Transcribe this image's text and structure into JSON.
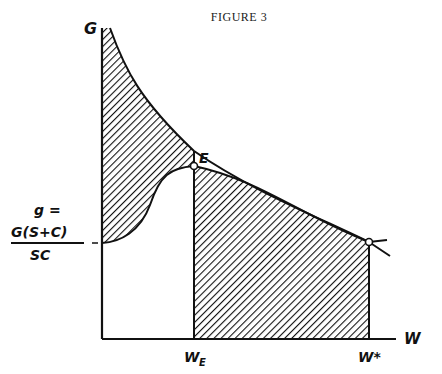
{
  "title": "FIGURE 3",
  "axes": {
    "y_label": "G",
    "x_label": "W"
  },
  "labels": {
    "point_E": "E",
    "w_e_main": "W",
    "w_e_sub": "E",
    "w_star": "W*",
    "intercept_line1": "g =",
    "intercept_numerator": "G(S+C)",
    "intercept_denominator": "SC"
  },
  "colors": {
    "ink": "#111111",
    "background": "#ffffff"
  }
}
